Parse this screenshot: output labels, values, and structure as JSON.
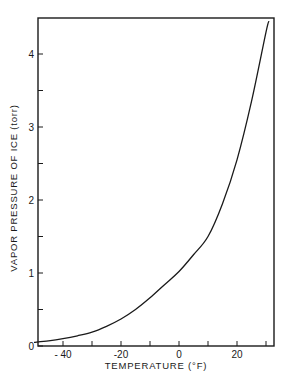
{
  "chart_data": {
    "type": "line",
    "title": "",
    "xlabel": "TEMPERATURE (°F)",
    "ylabel": "VAPOR PRESSURE OF ICE (torr)",
    "xlim": [
      -50,
      32.5
    ],
    "ylim": [
      0,
      4.5
    ],
    "grid": false,
    "legend": null,
    "x_ticks": [
      -40,
      -30,
      -20,
      -10,
      0,
      10,
      20,
      30
    ],
    "x_tick_labels": [
      {
        "value": -40,
        "label": "- 40"
      },
      {
        "value": -20,
        "label": "-20"
      },
      {
        "value": 0,
        "label": "0"
      },
      {
        "value": 20,
        "label": "20"
      }
    ],
    "y_ticks": [
      0,
      0.5,
      1,
      1.5,
      2,
      2.5,
      3,
      3.5,
      4
    ],
    "y_tick_labels": [
      {
        "value": 0,
        "label": "0"
      },
      {
        "value": 1,
        "label": "1"
      },
      {
        "value": 2,
        "label": "2"
      },
      {
        "value": 3,
        "label": "3"
      },
      {
        "value": 4,
        "label": "4"
      }
    ],
    "series": [
      {
        "name": "Vapor pressure of ice",
        "color": "#1a1a1a",
        "x": [
          -50,
          -45,
          -40,
          -35,
          -30,
          -25,
          -20,
          -15,
          -10,
          -5,
          0,
          5,
          10,
          15,
          20,
          25,
          30,
          31
        ],
        "y": [
          0.05,
          0.07,
          0.1,
          0.14,
          0.19,
          0.27,
          0.37,
          0.5,
          0.66,
          0.84,
          1.02,
          1.25,
          1.5,
          1.95,
          2.55,
          3.35,
          4.3,
          4.45
        ]
      }
    ]
  },
  "plot": {
    "left": 38,
    "top": 18,
    "right": 274,
    "bottom": 346,
    "x_px_per_unit": 2.9,
    "x_origin_px": 179,
    "y_px_per_unit": 73,
    "y_origin_px": 346
  },
  "colors": {
    "ink": "#1a1a1a",
    "background": "#ffffff"
  }
}
